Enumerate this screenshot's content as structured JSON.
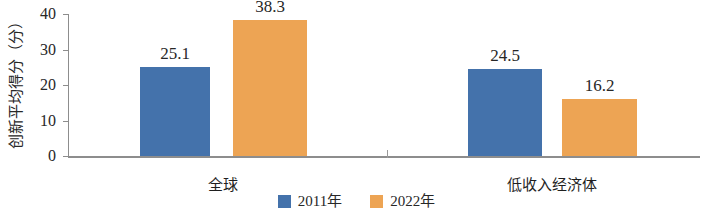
{
  "chart_data": {
    "type": "bar",
    "title": "",
    "subtitle": "",
    "xlabel": "",
    "ylabel": "创新平均得分（分）",
    "categories": [
      "全球",
      "低收入经济体"
    ],
    "series": [
      {
        "name": "2011年",
        "color": "#4472ab",
        "values": [
          25.1,
          24.5
        ]
      },
      {
        "name": "2022年",
        "color": "#eda454",
        "values": [
          38.3,
          16.2
        ]
      }
    ],
    "value_labels": [
      [
        "25.1",
        "38.3"
      ],
      [
        "24.5",
        "16.2"
      ]
    ],
    "ylim": [
      0,
      40
    ],
    "yticks": [
      0,
      10,
      20,
      30,
      40
    ],
    "ytick_labels": [
      "0",
      "10",
      "20",
      "30",
      "40"
    ],
    "grid": false,
    "legend_position": "bottom"
  },
  "axis": {
    "y_title": "创新平均得分（分）",
    "tick_0": "0",
    "tick_10": "10",
    "tick_20": "20",
    "tick_30": "30",
    "tick_40": "40"
  },
  "categories": {
    "global": "全球",
    "low_income": "低收入经济体"
  },
  "bars": {
    "g1s1": "25.1",
    "g1s2": "38.3",
    "g2s1": "24.5",
    "g2s2": "16.2"
  },
  "legend": {
    "item1": "2011年",
    "item2": "2022年"
  },
  "colors": {
    "series_2011": "#4472ab",
    "series_2022": "#eda454",
    "axis": "#8d8d8d",
    "text": "#272727"
  }
}
